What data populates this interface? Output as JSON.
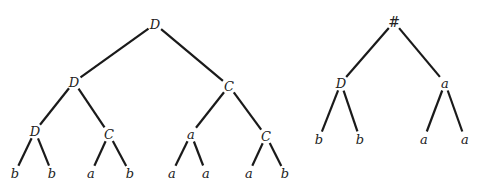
{
  "diagram": {
    "type": "tree-pair",
    "trees": [
      {
        "id": "tree-left",
        "nodes": [
          {
            "id": "n0",
            "label": "D",
            "x": 155,
            "y": 24
          },
          {
            "id": "n1",
            "label": "D",
            "x": 74,
            "y": 82
          },
          {
            "id": "n2",
            "label": "C",
            "x": 229,
            "y": 86
          },
          {
            "id": "n3",
            "label": "D",
            "x": 35,
            "y": 131
          },
          {
            "id": "n4",
            "label": "C",
            "x": 109,
            "y": 134
          },
          {
            "id": "n5",
            "label": "a",
            "x": 191,
            "y": 134
          },
          {
            "id": "n6",
            "label": "C",
            "x": 266,
            "y": 136
          },
          {
            "id": "n7",
            "label": "b",
            "x": 15,
            "y": 173
          },
          {
            "id": "n8",
            "label": "b",
            "x": 52,
            "y": 173
          },
          {
            "id": "n9",
            "label": "a",
            "x": 91,
            "y": 173
          },
          {
            "id": "n10",
            "label": "b",
            "x": 130,
            "y": 173
          },
          {
            "id": "n11",
            "label": "a",
            "x": 172,
            "y": 173
          },
          {
            "id": "n12",
            "label": "a",
            "x": 206,
            "y": 173
          },
          {
            "id": "n13",
            "label": "a",
            "x": 249,
            "y": 173
          },
          {
            "id": "n14",
            "label": "b",
            "x": 285,
            "y": 173
          }
        ],
        "edges": [
          [
            "n0",
            "n1"
          ],
          [
            "n0",
            "n2"
          ],
          [
            "n1",
            "n3"
          ],
          [
            "n1",
            "n4"
          ],
          [
            "n2",
            "n5"
          ],
          [
            "n2",
            "n6"
          ],
          [
            "n3",
            "n7"
          ],
          [
            "n3",
            "n8"
          ],
          [
            "n4",
            "n9"
          ],
          [
            "n4",
            "n10"
          ],
          [
            "n5",
            "n11"
          ],
          [
            "n5",
            "n12"
          ],
          [
            "n6",
            "n13"
          ],
          [
            "n6",
            "n14"
          ]
        ]
      },
      {
        "id": "tree-right",
        "nodes": [
          {
            "id": "m0",
            "label": "#",
            "x": 394,
            "y": 22
          },
          {
            "id": "m1",
            "label": "D",
            "x": 341,
            "y": 83
          },
          {
            "id": "m2",
            "label": "a",
            "x": 445,
            "y": 83
          },
          {
            "id": "m3",
            "label": "b",
            "x": 319,
            "y": 139
          },
          {
            "id": "m4",
            "label": "b",
            "x": 360,
            "y": 139
          },
          {
            "id": "m5",
            "label": "a",
            "x": 424,
            "y": 139
          },
          {
            "id": "m6",
            "label": "a",
            "x": 465,
            "y": 139
          }
        ],
        "edges": [
          [
            "m0",
            "m1"
          ],
          [
            "m0",
            "m2"
          ],
          [
            "m1",
            "m3"
          ],
          [
            "m1",
            "m4"
          ],
          [
            "m2",
            "m5"
          ],
          [
            "m2",
            "m6"
          ]
        ]
      }
    ],
    "colors": {
      "line": "#1a1a1a",
      "text": "#222222",
      "background": "#ffffff"
    }
  }
}
